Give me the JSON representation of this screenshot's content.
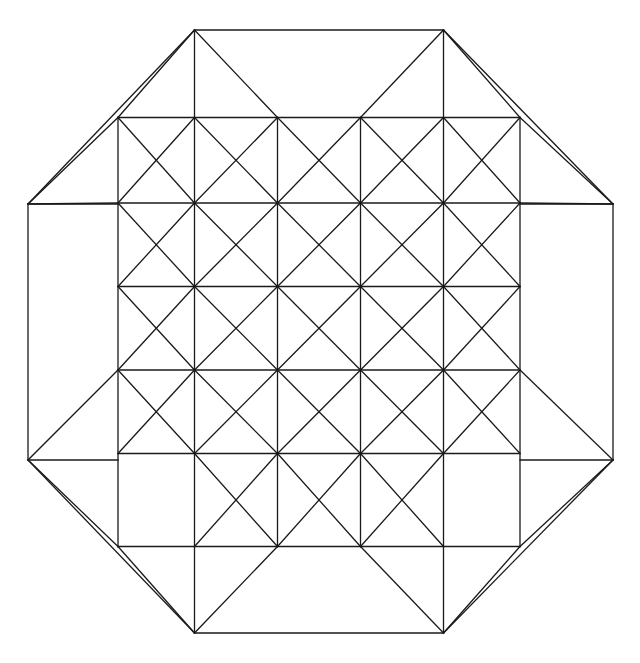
{
  "document": {
    "title": "Octagonal Triangulated Grid Figure",
    "background_color": "#ffffff",
    "width": 640,
    "height": 663
  },
  "figure": {
    "name": "octagon-triangulated-grid",
    "line_color": "#1a1a1a",
    "line_width": 1.3,
    "fill": "none"
  },
  "chart_data": {
    "type": "diagram",
    "xlabel": "",
    "ylabel": "",
    "xlim": [
      0,
      640
    ],
    "ylim": [
      0,
      663
    ],
    "grid": false,
    "legend": "none",
    "geometry": {
      "grid": {
        "rows": 4,
        "cols": 4,
        "x_positions": [
          194.5,
          277.5,
          360.5,
          443.5
        ],
        "y_positions": [
          117.5,
          203.0,
          286.5,
          370.0,
          453.5
        ],
        "x_min": 194.5,
        "x_max": 443.5,
        "y_min": 117.5,
        "y_max": 453.5,
        "cell_size": 83.0
      },
      "ring": {
        "x_positions": [
          118.0,
          194.5,
          277.5,
          360.5,
          443.5,
          520.0
        ],
        "y_positions": [
          117.5,
          203.0,
          286.5,
          370.0,
          453.5,
          546.5
        ],
        "x_min": 118.0,
        "x_max": 520.0,
        "y_min": 117.5,
        "y_max": 546.5
      },
      "octagon_vertices": [
        [
          194.5,
          30.0
        ],
        [
          443.5,
          30.0
        ],
        [
          613.0,
          204.0
        ],
        [
          613.0,
          460.0
        ],
        [
          443.5,
          633.0
        ],
        [
          194.5,
          633.0
        ],
        [
          28.0,
          460.0
        ],
        [
          28.0,
          204.0
        ]
      ],
      "octagon_vertex_count": 8
    },
    "nodes": [
      [
        194.5,
        30.0
      ],
      [
        443.5,
        30.0
      ],
      [
        613.0,
        204.0
      ],
      [
        613.0,
        460.0
      ],
      [
        443.5,
        633.0
      ],
      [
        194.5,
        633.0
      ],
      [
        28.0,
        460.0
      ],
      [
        28.0,
        204.0
      ],
      [
        118.0,
        117.5
      ],
      [
        520.0,
        117.5
      ],
      [
        118.0,
        546.5
      ],
      [
        520.0,
        546.5
      ],
      [
        194.5,
        117.5
      ],
      [
        277.5,
        117.5
      ],
      [
        360.5,
        117.5
      ],
      [
        443.5,
        117.5
      ],
      [
        118.0,
        203.0
      ],
      [
        194.5,
        203.0
      ],
      [
        277.5,
        203.0
      ],
      [
        360.5,
        203.0
      ],
      [
        443.5,
        203.0
      ],
      [
        520.0,
        203.0
      ],
      [
        118.0,
        286.5
      ],
      [
        194.5,
        286.5
      ],
      [
        277.5,
        286.5
      ],
      [
        360.5,
        286.5
      ],
      [
        443.5,
        286.5
      ],
      [
        520.0,
        286.5
      ],
      [
        118.0,
        370.0
      ],
      [
        194.5,
        370.0
      ],
      [
        277.5,
        370.0
      ],
      [
        360.5,
        370.0
      ],
      [
        443.5,
        370.0
      ],
      [
        520.0,
        370.0
      ],
      [
        118.0,
        453.5
      ],
      [
        194.5,
        453.5
      ],
      [
        277.5,
        453.5
      ],
      [
        360.5,
        453.5
      ],
      [
        443.5,
        453.5
      ],
      [
        520.0,
        453.5
      ],
      [
        194.5,
        546.5
      ],
      [
        277.5,
        546.5
      ],
      [
        360.5,
        546.5
      ],
      [
        443.5,
        546.5
      ]
    ]
  },
  "labels": {
    "none": ""
  }
}
